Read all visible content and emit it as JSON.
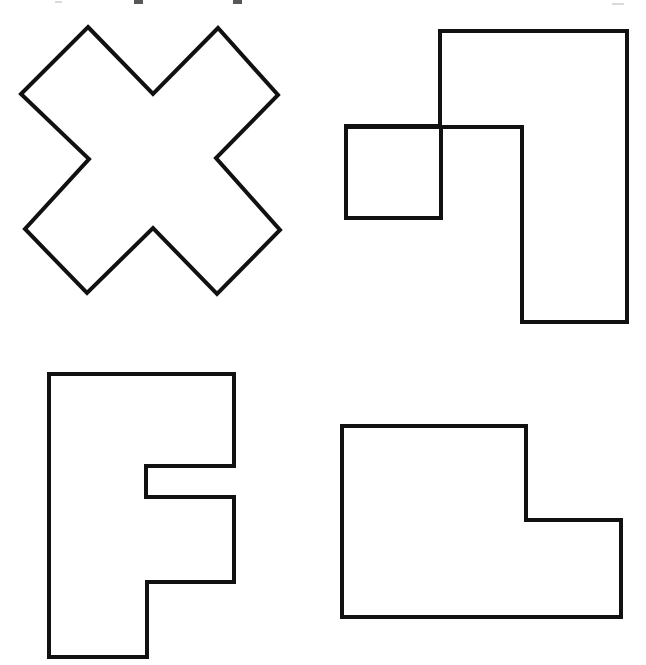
{
  "page": {
    "background_color": "#ffffff",
    "stroke_color": "#111111",
    "fill_color": "#ffffff",
    "stroke_width": 4,
    "width": 646,
    "height": 665
  },
  "shapes": [
    {
      "id": "cross-shape",
      "name": "x-cross-shape",
      "label": "X cross",
      "description": "Eight-sided rotated cross (X) outline, top-left quadrant",
      "sides": 12,
      "points": "88,27 153,94 218,28 278,95 216,158 280,230 217,294 153,228 87,293 25,229 89,159 21,94",
      "bbox": {
        "x": 21,
        "y": 27,
        "width": 259,
        "height": 267
      }
    },
    {
      "id": "square-and-rect-shape",
      "name": "overlapping-square-and-rectangle-shape",
      "label": "Overlapping square and rectangle",
      "description": "A small square overlapping a tall stepped rectangle, top-right quadrant",
      "parts": [
        {
          "id": "small-square",
          "name": "small-square-outline",
          "points": "346,126 441,126 441,218 346,218",
          "bbox": {
            "x": 346,
            "y": 126,
            "width": 95,
            "height": 92
          }
        },
        {
          "id": "stepped-rectangle",
          "name": "stepped-rectangle-outline",
          "points": "440,31 627,31 627,322 522,322 522,127 347,127 347,126 440,126",
          "bbox": {
            "x": 347,
            "y": 31,
            "width": 280,
            "height": 291
          }
        }
      ]
    },
    {
      "id": "letter-f-shape",
      "name": "letter-f-shape",
      "label": "Letter F block",
      "description": "Block capital letter F outline, bottom-left quadrant",
      "sides": 8,
      "points": "49,374 234,374 234,466 146,466 146,497 234,497 234,582 147,582 147,657 49,657",
      "bbox": {
        "x": 49,
        "y": 374,
        "width": 185,
        "height": 283
      }
    },
    {
      "id": "l-step-shape",
      "name": "stepped-l-shape",
      "label": "Stepped L polygon",
      "description": "Six-sided stepped rectangle (L rotated), bottom-right quadrant",
      "sides": 6,
      "points": "342,426 526,426 526,520 621,520 621,617 342,617",
      "bbox": {
        "x": 342,
        "y": 426,
        "width": 279,
        "height": 191
      }
    }
  ],
  "artifacts": [
    {
      "id": "mark-1",
      "name": "crop-artifact-mark",
      "x": 134,
      "y": 0,
      "width": 9,
      "height": 4,
      "faint": false
    },
    {
      "id": "mark-2",
      "name": "crop-artifact-mark",
      "x": 233,
      "y": 0,
      "width": 9,
      "height": 4,
      "faint": false
    },
    {
      "id": "mark-3",
      "name": "crop-artifact-mark",
      "x": 55,
      "y": 1,
      "width": 7,
      "height": 2,
      "faint": true
    },
    {
      "id": "mark-4",
      "name": "crop-artifact-mark",
      "x": 612,
      "y": 3,
      "width": 12,
      "height": 2,
      "faint": true
    }
  ]
}
